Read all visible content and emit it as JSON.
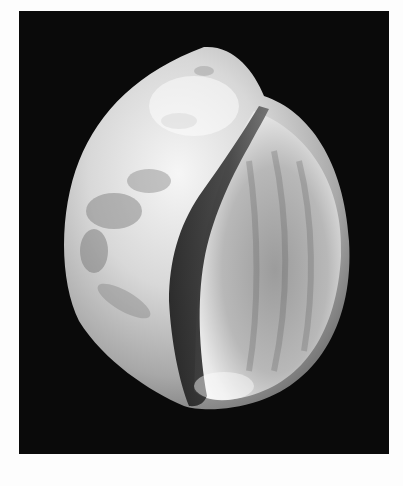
{
  "image": {
    "subject": "seashell",
    "description": "Grayscale photograph of a moon snail shell on a black background",
    "colors": {
      "page_background": "#fdfdfd",
      "photo_background": "#0a0a0a",
      "shell_highlight": "#f4f4f4",
      "shell_midtone": "#9a9a9a",
      "aperture_shadow": "#1e1e1e"
    }
  }
}
